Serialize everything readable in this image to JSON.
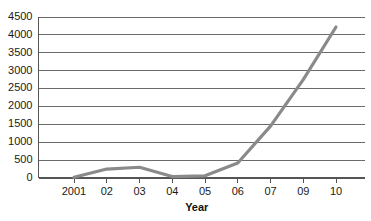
{
  "chart_data": {
    "type": "line",
    "title": "",
    "xlabel": "Year",
    "ylabel": "",
    "grid": true,
    "legend": false,
    "ylim": [
      0,
      4500
    ],
    "yticks": [
      0,
      500,
      1000,
      1500,
      2000,
      2500,
      3000,
      3500,
      4000,
      4500
    ],
    "ytick_labels": [
      "0",
      "500",
      "1000",
      "1500",
      "2000",
      "2500",
      "3000",
      "3500",
      "4000",
      "4500"
    ],
    "categories": [
      "2001",
      "02",
      "03",
      "04",
      "05",
      "06",
      "07",
      "09",
      "10"
    ],
    "x": [
      2001,
      2002,
      2003,
      2004,
      2005,
      2006,
      2007,
      2008,
      2009
    ],
    "values": [
      20,
      250,
      300,
      40,
      60,
      420,
      1450,
      2750,
      4220
    ],
    "series": [
      {
        "name": "",
        "color": "#8a8a8a",
        "values": [
          20,
          250,
          300,
          40,
          60,
          420,
          1450,
          2750,
          4220
        ]
      }
    ],
    "line_color": "#8a8a8a",
    "grid_color": "#6b6b6b",
    "axis_color": "#555555"
  }
}
